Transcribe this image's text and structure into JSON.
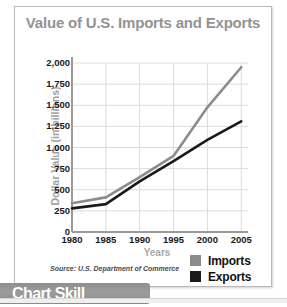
{
  "title": "Value of U.S. Imports and Exports",
  "banner": {
    "label": "Chart Skill"
  },
  "source": {
    "note": "Source: U.S. Department of Commerce"
  },
  "legend": {
    "position": "bottom-right",
    "items": [
      {
        "label": "Imports",
        "color": "#8c8c8c"
      },
      {
        "label": "Exports",
        "color": "#1a1a1a"
      }
    ]
  },
  "colors": {
    "title": "#939393",
    "axis_title": "#a0a0a0",
    "gridline": "#dcdcdc",
    "axis_line": "#9a9a9a",
    "imports_line": "#8c8c8c",
    "exports_line": "#111111",
    "frame": "#b9b9b9",
    "banner_bg": "#9c9c9c"
  },
  "chart_data": {
    "type": "line",
    "title": "Value of U.S. Imports and Exports",
    "xlabel": "Years",
    "ylabel": "Dollar Value (in billions)",
    "x": [
      1980,
      1985,
      1990,
      1995,
      2000,
      2005
    ],
    "xtick_labels": [
      "1980",
      "1985",
      "1990",
      "1995",
      "2000",
      "2005"
    ],
    "xlim": [
      1980,
      2006
    ],
    "ylim": [
      0,
      2000
    ],
    "ytick_values": [
      0,
      250,
      500,
      750,
      1000,
      1250,
      1500,
      1750,
      2000
    ],
    "ytick_labels": [
      "0",
      "250",
      "500",
      "750",
      "1,000",
      "1,250",
      "1,500",
      "1,750",
      "2,000"
    ],
    "grid": true,
    "legend_position": "bottom-right",
    "series": [
      {
        "name": "Imports",
        "color": "#8c8c8c",
        "values": [
          340,
          410,
          650,
          900,
          1475,
          1950
        ]
      },
      {
        "name": "Exports",
        "color": "#1a1a1a",
        "values": [
          280,
          330,
          600,
          840,
          1090,
          1310
        ]
      }
    ]
  }
}
